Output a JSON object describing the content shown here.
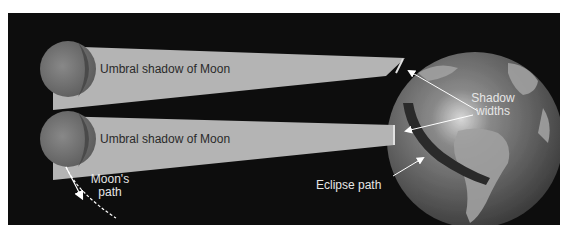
{
  "diagram": {
    "labels": {
      "shadow_top": "Umbral shadow of Moon",
      "shadow_bottom": "Umbral shadow of Moon",
      "moon_path_line1": "Moon's",
      "moon_path_line2": "path",
      "shadow_widths_line1": "Shadow",
      "shadow_widths_line2": "widths",
      "eclipse_path": "Eclipse path"
    },
    "colors": {
      "background": "#0d0d0d",
      "shadow_cone": "#b8b8b8",
      "moon": "#7a7a7a",
      "earth_ocean": "#5a5a5a",
      "earth_land": "#a8a8a8",
      "eclipse_band": "#2a2a2a",
      "arrow": "#ffffff"
    }
  }
}
